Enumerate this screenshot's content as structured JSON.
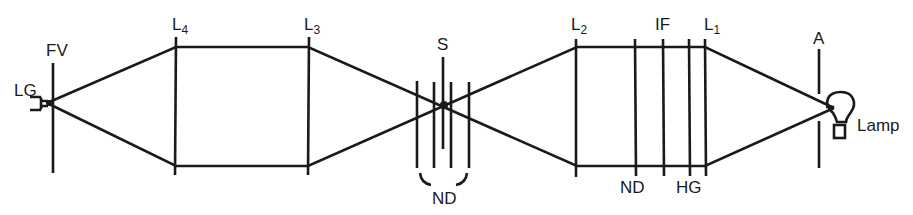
{
  "diagram": {
    "type": "optical-path-schematic",
    "labels": {
      "lg": "LG",
      "fv": "FV",
      "l4": "L",
      "l4_sub": "4",
      "l3": "L",
      "l3_sub": "3",
      "s": "S",
      "nd_group": "ND",
      "l2": "L",
      "l2_sub": "2",
      "if": "IF",
      "l1": "L",
      "l1_sub": "1",
      "nd": "ND",
      "hg": "HG",
      "a": "A",
      "lamp": "Lamp"
    },
    "elements": [
      {
        "id": "LG",
        "label": "LG",
        "x": 45
      },
      {
        "id": "FV",
        "label": "FV",
        "x": 53
      },
      {
        "id": "L4",
        "label": "L4",
        "x": 176
      },
      {
        "id": "L3",
        "label": "L3",
        "x": 308
      },
      {
        "id": "ND-group",
        "label": "ND",
        "x": [
          417,
          434,
          451,
          469
        ]
      },
      {
        "id": "S",
        "label": "S",
        "x": 443
      },
      {
        "id": "L2",
        "label": "L2",
        "x": 576
      },
      {
        "id": "ND",
        "label": "ND",
        "x": 635
      },
      {
        "id": "IF",
        "label": "IF",
        "x": 663
      },
      {
        "id": "HG",
        "label": "HG",
        "x": 690
      },
      {
        "id": "L1",
        "label": "L1",
        "x": 705
      },
      {
        "id": "A",
        "label": "A",
        "x": 818
      },
      {
        "id": "Lamp",
        "label": "Lamp",
        "x": 842
      }
    ],
    "colors": {
      "stroke": "#1a1a1a",
      "background": "#ffffff"
    }
  }
}
